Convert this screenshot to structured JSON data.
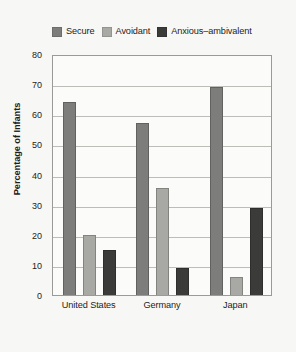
{
  "chart_data": {
    "type": "bar",
    "title": "",
    "xlabel": "",
    "ylabel": "Percentage of Infants",
    "ylim": [
      0,
      80
    ],
    "ytick_step": 10,
    "yticks": [
      0,
      10,
      20,
      30,
      40,
      50,
      60,
      70,
      80
    ],
    "grid": true,
    "legend_position": "top",
    "categories": [
      "United States",
      "Germany",
      "Japan"
    ],
    "series": [
      {
        "name": "Secure",
        "color": "#7d7d7b",
        "values": [
          64,
          57,
          69
        ]
      },
      {
        "name": "Avoidant",
        "color": "#a8a8a4",
        "values": [
          20,
          35.5,
          6
        ]
      },
      {
        "name": "Anxious–ambivalent",
        "color": "#3b3b3a",
        "values": [
          15,
          9,
          29
        ]
      }
    ]
  },
  "legend": {
    "entries": [
      {
        "label": "Secure",
        "swatch": "#7d7d7b"
      },
      {
        "label": "Avoidant",
        "swatch": "#a8a8a4"
      },
      {
        "label": "Anxious–ambivalent",
        "swatch": "#3b3b3a"
      }
    ]
  },
  "axes": {
    "y_title": "Percentage of Infants",
    "y_tick_labels": [
      "80",
      "70",
      "60",
      "50",
      "40",
      "30",
      "20",
      "10",
      "0"
    ],
    "x_tick_labels": [
      "United States",
      "Germany",
      "Japan"
    ]
  },
  "colors": {
    "page_background": "#f7f7f5",
    "plot_background": "#fbfbfa",
    "frame": "#9a9a96",
    "gridline": "#bcbcb8",
    "text": "#1d1d1b"
  }
}
